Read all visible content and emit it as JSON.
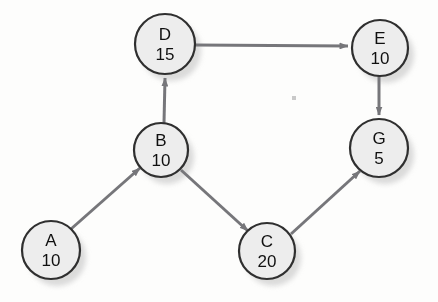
{
  "diagram": {
    "type": "directed-graph",
    "title": "",
    "background_color": "#fdfdfc",
    "node_fill_color": "#ededed",
    "node_stroke_color": "#2f2f2f",
    "edge_color": "#76767a",
    "node_shadow_color": "#cfcfcf",
    "nodes": [
      {
        "id": "A",
        "label": "A",
        "value": "10",
        "cx": 51,
        "cy": 250,
        "r": 29
      },
      {
        "id": "B",
        "label": "B",
        "value": "10",
        "cx": 161,
        "cy": 150,
        "r": 27
      },
      {
        "id": "C",
        "label": "C",
        "value": "20",
        "cx": 267,
        "cy": 251,
        "r": 28
      },
      {
        "id": "D",
        "label": "D",
        "value": "15",
        "cx": 165,
        "cy": 44,
        "r": 30
      },
      {
        "id": "E",
        "label": "E",
        "value": "10",
        "cx": 380,
        "cy": 48,
        "r": 28
      },
      {
        "id": "G",
        "label": "G",
        "value": "5",
        "cx": 379,
        "cy": 148,
        "r": 29
      }
    ],
    "edges": [
      {
        "from": "A",
        "to": "B",
        "directed": true
      },
      {
        "from": "B",
        "to": "D",
        "directed": true
      },
      {
        "from": "B",
        "to": "C",
        "directed": true
      },
      {
        "from": "D",
        "to": "E",
        "directed": true
      },
      {
        "from": "E",
        "to": "G",
        "directed": true
      },
      {
        "from": "C",
        "to": "G",
        "directed": true
      }
    ]
  }
}
